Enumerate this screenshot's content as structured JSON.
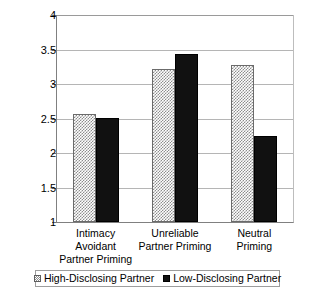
{
  "chart_data": {
    "type": "bar",
    "title": "",
    "subtitle": "",
    "xlabel": "",
    "ylabel": "",
    "categories": [
      "Intimacy Avoidant Partner Priming",
      "Unreliable Partner Priming",
      "Neutral Priming"
    ],
    "category_lines": [
      [
        "Intimacy Avoidant",
        "Partner Priming"
      ],
      [
        "Unreliable",
        "Partner Priming"
      ],
      [
        "Neutral",
        "Priming"
      ]
    ],
    "series": [
      {
        "name": "High-Disclosing Partner",
        "values": [
          2.56,
          3.22,
          3.28
        ],
        "fill": "checkered",
        "color": "#8d8d8d"
      },
      {
        "name": "Low-Disclosing Partner",
        "values": [
          2.51,
          3.44,
          2.24
        ],
        "fill": "solid",
        "color": "#111111"
      }
    ],
    "ylim": [
      1,
      4
    ],
    "ytick_values": [
      4,
      3.5,
      3,
      2.5,
      2,
      1.5,
      1
    ],
    "ytick_labels": [
      "4",
      "3.5",
      "3",
      "2.5",
      "2",
      "1.5",
      "1"
    ],
    "grid": true,
    "grid_axis": "y",
    "legend_position": "bottom",
    "legend": [
      "High-Disclosing Partner",
      "Low-Disclosing Partner"
    ]
  }
}
